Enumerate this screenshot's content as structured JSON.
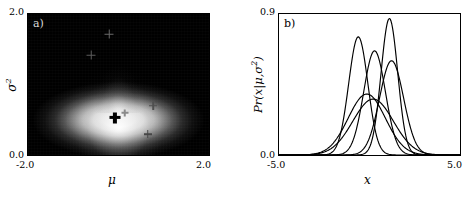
{
  "figure": {
    "background": "#ffffff",
    "panels": [
      "a",
      "b"
    ]
  },
  "panel_a": {
    "letter": "a)",
    "letter_color": "#d8d8d8",
    "background_color": "#000000",
    "glow_color": "#ffffff",
    "xlabel": "μ",
    "ylabel_base": "σ",
    "ylabel_exponent": "2",
    "x_tick_min": "-2.0",
    "x_tick_max": "2.0",
    "y_tick_min": "0.0",
    "y_tick_max": "2.0",
    "chart_data": {
      "type": "heatmap",
      "title": "",
      "xlabel": "μ",
      "ylabel": "σ²",
      "xlim": [
        -2.0,
        2.0
      ],
      "ylim": [
        0.0,
        2.0
      ],
      "xticks": [
        -2.0,
        2.0
      ],
      "yticks": [
        0.0,
        2.0
      ],
      "xticklabels": [
        "-2.0",
        "2.0"
      ],
      "yticklabels": [
        "0.0",
        "2.0"
      ],
      "grid": false,
      "legend": "none",
      "colormap": "gray",
      "description": "Posterior density Pr(mu, sigma^2) shown as a grayscale image; bright white lobe centred near mu = -0.1, sigma^2 = 0.55, fading to black at the edges, with a faint vertical plume rising toward larger sigma^2.",
      "density_peak": {
        "mu": -0.1,
        "sigma2": 0.55
      },
      "markers": [
        {
          "name": "map-estimate",
          "mu": -0.1,
          "sigma2": 0.55,
          "style": "bold-black-cross",
          "color": "#000000",
          "size": 11
        },
        {
          "name": "sample-1",
          "mu": -0.22,
          "sigma2": 1.72,
          "style": "faint-gray-cross",
          "color": "#6a6a6a",
          "size": 9
        },
        {
          "name": "sample-2",
          "mu": -0.62,
          "sigma2": 1.42,
          "style": "faint-gray-cross",
          "color": "#5c5c5c",
          "size": 9
        },
        {
          "name": "sample-3",
          "mu": 0.74,
          "sigma2": 0.72,
          "style": "faint-gray-cross",
          "color": "#4f4f4f",
          "size": 8
        },
        {
          "name": "sample-4",
          "mu": 0.62,
          "sigma2": 0.32,
          "style": "faint-gray-cross",
          "color": "#474747",
          "size": 8
        },
        {
          "name": "sample-5",
          "mu": 0.12,
          "sigma2": 0.62,
          "style": "faint-gray-cross",
          "color": "#8a8a8a",
          "size": 7
        }
      ]
    }
  },
  "panel_b": {
    "letter": "b)",
    "letter_color": "#000000",
    "background_color": "#ffffff",
    "curve_color": "#000000",
    "xlabel": "x",
    "ylabel_prefix": "Pr(",
    "ylabel_var": "x",
    "ylabel_bar": "|",
    "ylabel_mu": "μ",
    "ylabel_comma": ",",
    "ylabel_sigma": "σ",
    "ylabel_exponent": "2",
    "ylabel_suffix": ")",
    "x_tick_min": "-5.0",
    "x_tick_max": "5.0",
    "y_tick_min": "0.0",
    "y_tick_max": "0.9",
    "chart_data": {
      "type": "line",
      "title": "",
      "xlabel": "x",
      "ylabel": "Pr(x|μ,σ²)",
      "xlim": [
        -5.0,
        5.0
      ],
      "ylim": [
        0.0,
        0.9
      ],
      "xticks": [
        -5.0,
        5.0
      ],
      "yticks": [
        0.0,
        0.9
      ],
      "xticklabels": [
        "-5.0",
        "5.0"
      ],
      "yticklabels": [
        "0.0",
        "0.9"
      ],
      "grid": false,
      "legend": "none",
      "description": "Six univariate normal probability density functions drawn as thin black lines; each is a sample (mu, sigma^2) drawn from the posterior shown in panel a.",
      "series": [
        {
          "name": "curve-1",
          "mu": -0.62,
          "sigma2": 0.28,
          "sigma": 0.529,
          "peak_x": -0.62,
          "peak_y": 0.754
        },
        {
          "name": "curve-2",
          "mu": 0.28,
          "sigma2": 0.36,
          "sigma": 0.6,
          "peak_x": 0.28,
          "peak_y": 0.665
        },
        {
          "name": "curve-3",
          "mu": 1.1,
          "sigma2": 0.21,
          "sigma": 0.458,
          "peak_x": 1.1,
          "peak_y": 0.87
        },
        {
          "name": "curve-4",
          "mu": 1.22,
          "sigma2": 0.44,
          "sigma": 0.663,
          "peak_x": 1.22,
          "peak_y": 0.601
        },
        {
          "name": "curve-5",
          "mu": -0.15,
          "sigma2": 1.05,
          "sigma": 1.025,
          "peak_x": -0.15,
          "peak_y": 0.389
        },
        {
          "name": "curve-6",
          "mu": 0.2,
          "sigma2": 1.25,
          "sigma": 1.118,
          "peak_x": 0.2,
          "peak_y": 0.357
        }
      ]
    }
  }
}
